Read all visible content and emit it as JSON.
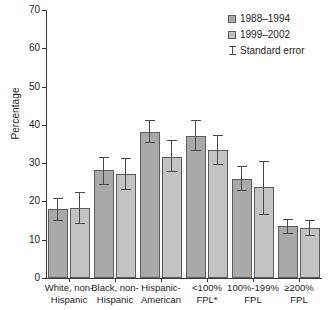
{
  "chart_data": {
    "type": "bar",
    "title": "",
    "xlabel": "",
    "ylabel": "Percentage",
    "ylim": [
      0,
      70
    ],
    "yticks": [
      0,
      10,
      20,
      30,
      40,
      50,
      60,
      70
    ],
    "grid": false,
    "legend_position": "top-right",
    "categories": [
      "White, non-\nHispanic",
      "Black, non-\nHispanic",
      "Hispanic-\nAmerican",
      "<100%\nFPL*",
      "100%-199%\nFPL",
      "≥200%\nFPL"
    ],
    "category_lines": [
      [
        "White, non-",
        "Hispanic"
      ],
      [
        "Black, non-",
        "Hispanic"
      ],
      [
        "Hispanic-",
        "American"
      ],
      [
        "<100%",
        "FPL*"
      ],
      [
        "100%-199%",
        "FPL"
      ],
      [
        "≥200%",
        "FPL"
      ]
    ],
    "series": [
      {
        "name": "1988–1994",
        "color": "#a9a9a9",
        "values": [
          17.9,
          28.1,
          38.2,
          37.1,
          25.8,
          13.5
        ],
        "errors_low": [
          15.0,
          24.4,
          35.2,
          33.3,
          22.6,
          11.6
        ],
        "errors_high": [
          20.8,
          31.7,
          41.4,
          41.2,
          29.2,
          15.5
        ]
      },
      {
        "name": "1999–2002",
        "color": "#c3c3c3",
        "values": [
          18.2,
          27.1,
          31.7,
          33.5,
          23.7,
          13.0
        ],
        "errors_low": [
          14.0,
          22.9,
          27.6,
          29.6,
          16.5,
          11.0
        ],
        "errors_high": [
          22.5,
          31.3,
          36.0,
          37.4,
          30.5,
          15.1
        ]
      }
    ],
    "legend_entries": [
      {
        "label": "1988–1994",
        "marker": "swatch"
      },
      {
        "label": "1999–2002",
        "marker": "swatch"
      },
      {
        "label": "Standard error",
        "marker": "ibeam"
      }
    ]
  }
}
